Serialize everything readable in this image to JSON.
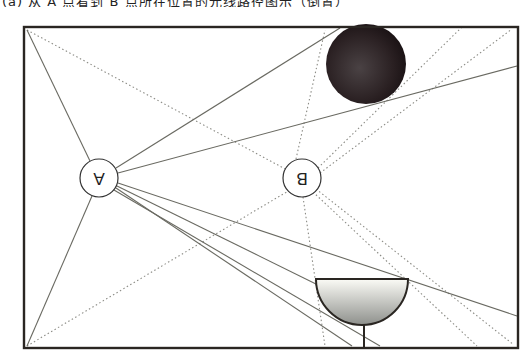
{
  "caption": "(a) 从 A 点看到 B 点所在位置的光线路径图示（倒置）",
  "diagram": {
    "orientation": "rotated 180 degrees",
    "frame": {
      "x1": 23,
      "y1": 27,
      "x2": 518,
      "y2": 348
    },
    "points": [
      {
        "id": "A",
        "label": "A",
        "cx": 99,
        "cy": 178,
        "r": 19
      },
      {
        "id": "B",
        "label": "B",
        "cx": 302,
        "cy": 178,
        "r": 19
      }
    ],
    "ball": {
      "cx": 366,
      "cy": 64,
      "r": 40,
      "color": "#2a2022"
    },
    "bowl": {
      "x1": 316,
      "x2": 408,
      "top_y": 279,
      "bottom_y": 325,
      "stem_x": 364,
      "stem_bottom": 348
    },
    "colors": {
      "frame": "#2a2622",
      "solid_line": "#6a6a62",
      "dotted_line": "#8c8c86"
    }
  }
}
